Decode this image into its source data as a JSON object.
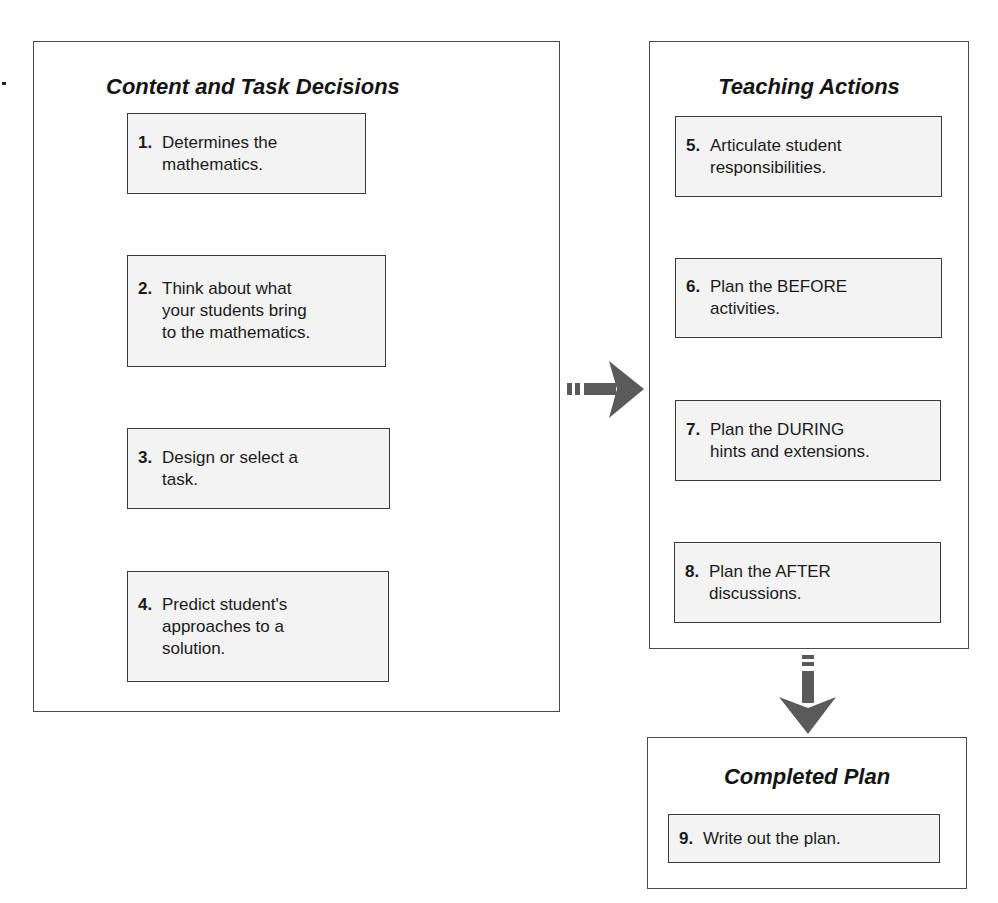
{
  "content_panel": {
    "title": "Content and Task Decisions",
    "steps": [
      {
        "num": "1.",
        "lines": [
          "Determines the",
          "mathematics."
        ]
      },
      {
        "num": "2.",
        "lines": [
          "Think about what",
          "your students bring",
          "to the mathematics."
        ]
      },
      {
        "num": "3.",
        "lines": [
          "Design or select a",
          "task."
        ]
      },
      {
        "num": "4.",
        "lines": [
          "Predict student's",
          "approaches to a",
          "solution."
        ]
      }
    ]
  },
  "teaching_panel": {
    "title": "Teaching Actions",
    "steps": [
      {
        "num": "5.",
        "lines": [
          "Articulate student",
          "responsibilities."
        ]
      },
      {
        "num": "6.",
        "lines": [
          "Plan the BEFORE",
          "activities."
        ]
      },
      {
        "num": "7.",
        "lines": [
          "Plan the DURING",
          "hints and extensions."
        ]
      },
      {
        "num": "8.",
        "lines": [
          "Plan the AFTER",
          "discussions."
        ]
      }
    ]
  },
  "completed_panel": {
    "title": "Completed Plan",
    "steps": [
      {
        "num": "9.",
        "lines": [
          "Write out the plan."
        ]
      }
    ]
  },
  "colors": {
    "flow_arrow": "#cfcfcf",
    "feedback_arrow": "#a9a9a9",
    "transition_arrow": "#5a5a5a",
    "box_fill": "#f3f3f3",
    "border": "#3a3a3a"
  }
}
